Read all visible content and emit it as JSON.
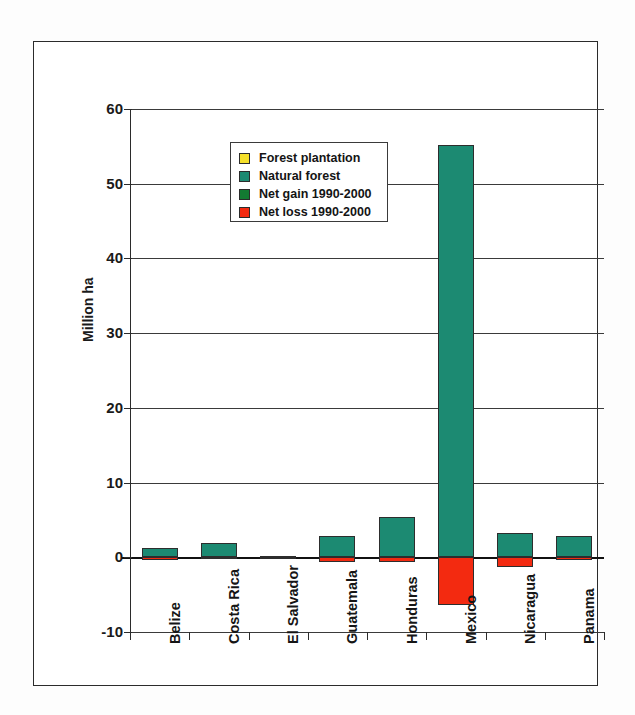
{
  "chart_data": {
    "type": "bar",
    "title": "",
    "xlabel": "",
    "ylabel": "Million ha",
    "ylim": [
      -10,
      60
    ],
    "yticks": [
      -10,
      0,
      10,
      20,
      30,
      40,
      50,
      60
    ],
    "ytick_labels": [
      "-10",
      "0",
      "10",
      "20",
      "30",
      "40",
      "50",
      "60"
    ],
    "grid": true,
    "stacked": true,
    "legend_position": "upper-left-inside",
    "categories": [
      "Belize",
      "Costa Rica",
      "El Salvador",
      "Guatemala",
      "Honduras",
      "Mexico",
      "Nicaragua",
      "Panama"
    ],
    "series": [
      {
        "name": "Forest plantation",
        "color": "#f5e02a",
        "values": [
          0.0,
          0.2,
          0.1,
          0.0,
          0.05,
          0.3,
          0.05,
          0.05
        ]
      },
      {
        "name": "Natural forest",
        "color": "#1c8a72",
        "values": [
          1.3,
          1.9,
          0.15,
          2.8,
          5.4,
          55.2,
          3.2,
          2.8
        ]
      },
      {
        "name": "Net gain 1990-2000",
        "color": "#137a32",
        "values": [
          0,
          0,
          0,
          0,
          0,
          0,
          0,
          0
        ]
      },
      {
        "name": "Net loss 1990-2000",
        "color": "#f32a10",
        "values": [
          -0.3,
          -0.2,
          -0.05,
          -0.6,
          -0.6,
          -6.4,
          -1.3,
          -0.4
        ]
      }
    ],
    "legend": [
      {
        "label": "Forest plantation",
        "color": "#f5e02a"
      },
      {
        "label": "Natural forest",
        "color": "#1c8a72"
      },
      {
        "label": "Net gain 1990-2000",
        "color": "#137a32"
      },
      {
        "label": "Net loss 1990-2000",
        "color": "#f32a10"
      }
    ]
  }
}
